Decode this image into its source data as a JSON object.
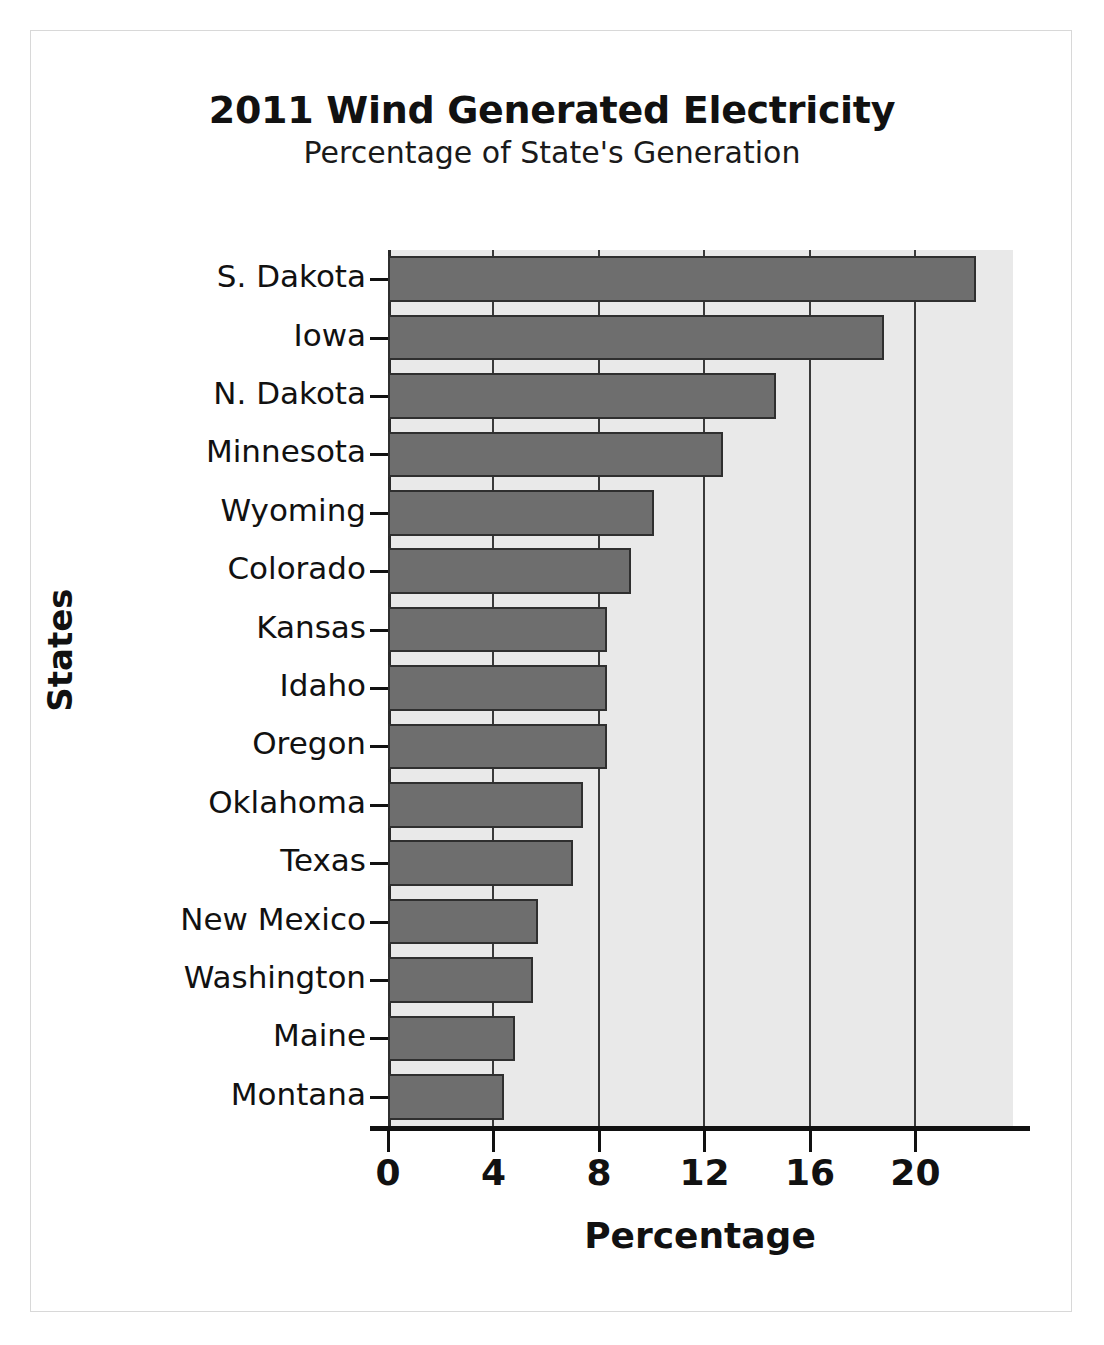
{
  "cutoff_header": "",
  "chart_data": {
    "type": "bar",
    "orientation": "horizontal",
    "title": "2011 Wind Generated Electricity",
    "subtitle": "Percentage of State's Generation",
    "xlabel": "Percentage",
    "ylabel": "States",
    "categories": [
      "S. Dakota",
      "Iowa",
      "N. Dakota",
      "Minnesota",
      "Wyoming",
      "Colorado",
      "Kansas",
      "Idaho",
      "Oregon",
      "Oklahoma",
      "Texas",
      "New Mexico",
      "Washington",
      "Maine",
      "Montana"
    ],
    "values": [
      22.3,
      18.8,
      14.7,
      12.7,
      10.1,
      9.2,
      8.3,
      8.3,
      8.3,
      7.4,
      7.0,
      5.7,
      5.5,
      4.8,
      4.4
    ],
    "xticks": [
      0,
      4,
      8,
      12,
      16,
      20
    ],
    "xlim": [
      0,
      23.7
    ],
    "grid": true,
    "legend": false,
    "bar_color": "#6e6e6e",
    "bar_edge_color": "#2f2f2f",
    "plot_bg_color": "#e9e9e9",
    "axis_color": "#111111"
  }
}
